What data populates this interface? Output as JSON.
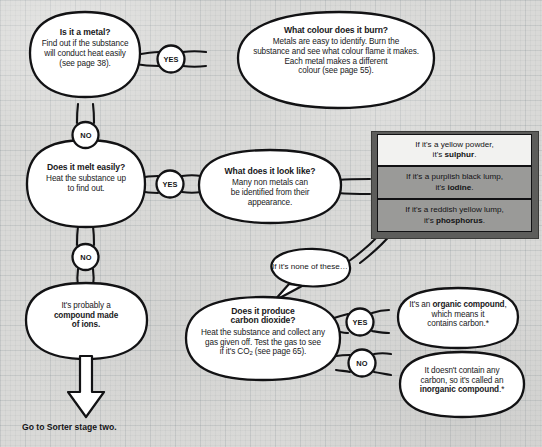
{
  "page": {
    "background_color": "#d9d9d7",
    "ink_color": "#111113",
    "grey_box_fill": "#9a9a98",
    "grey_frame_fill": "#5d5d5b"
  },
  "nodes": {
    "is_metal": {
      "heading": "Is it a metal?",
      "line1": "Find out if the substance",
      "line2": "will conduct heat easily",
      "line3": "(see page 38)."
    },
    "what_colour": {
      "heading": "What colour does it burn?",
      "line1": "Metals are easy to identify. Burn the",
      "line2": "substance and see what colour flame it makes.",
      "line3": "Each metal makes a different",
      "line4": "colour (see page 55)."
    },
    "melt_easily": {
      "heading": "Does it melt easily?",
      "line1": "Heat the substance up",
      "line2": "to find out."
    },
    "look_like": {
      "heading": "What does it look like?",
      "line1": "Many non metals can",
      "line2": "be identified from their",
      "line3": "appearance."
    },
    "ionic_compound": {
      "line1": "It's probably a",
      "line2_bold": "compound made",
      "line3_bold": "of ions."
    },
    "carbon_dioxide": {
      "heading1": "Does it produce",
      "heading2": "carbon dioxide?",
      "line1": "Heat the substance and collect any",
      "line2": "gas given off. Test the gas to see",
      "line3_pre": "if it's CO",
      "line3_sub": "2",
      "line3_post": " (see page 65)."
    },
    "organic": {
      "line1_pre": "It's an ",
      "line1_bold": "organic compound",
      "line1_post": ",",
      "line2": "which means it",
      "line3": "contains carbon.*"
    },
    "inorganic": {
      "line1": "It doesn't contain any",
      "line2": "carbon, so it's called an",
      "line3_bold": "inorganic compound",
      "line3_post": ".*"
    }
  },
  "results_boxes": [
    {
      "id": "sulphur",
      "line1": "If it's a yellow powder,",
      "line2_pre": "it's ",
      "line2_bold": "sulphur",
      "line2_post": ".",
      "fill": "white"
    },
    {
      "id": "iodine",
      "line1": "If it's a purplish black lump,",
      "line2_pre": "it's ",
      "line2_bold": "iodine",
      "line2_post": ".",
      "fill": "grey"
    },
    {
      "id": "phosphorus",
      "line1": "If it's a reddish yellow lump,",
      "line2_pre": "it's ",
      "line2_bold": "phosphorus",
      "line2_post": ".",
      "fill": "grey"
    }
  ],
  "badges": {
    "yes_metal": "YES",
    "no_metal": "NO",
    "yes_melt": "YES",
    "no_melt": "NO",
    "yes_co2": "YES",
    "no_co2": "NO"
  },
  "labels": {
    "none_of_these": "If it's none of these…",
    "go_to_stage_two": "Go to Sorter stage two."
  }
}
